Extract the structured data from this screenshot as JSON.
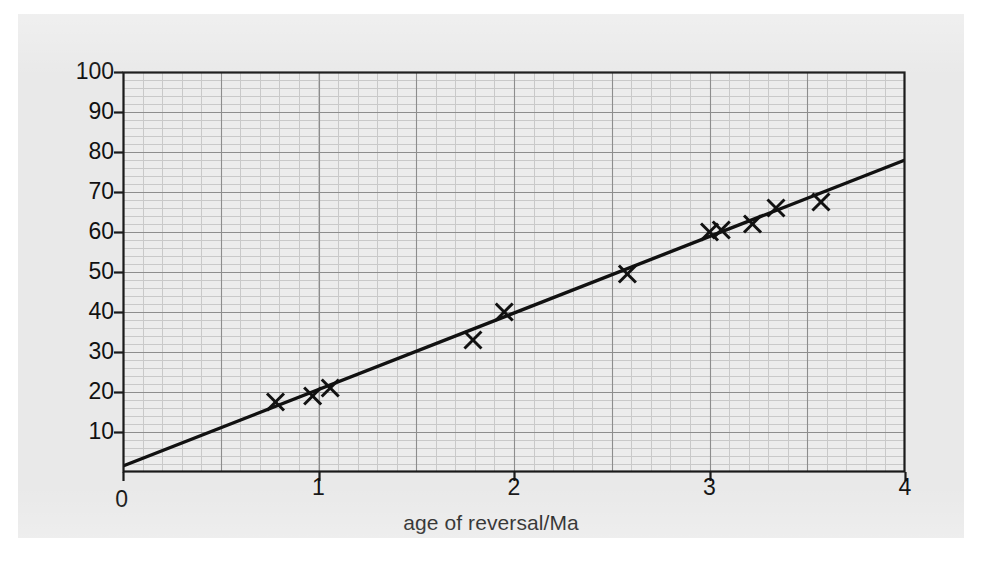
{
  "figure": {
    "background_color": "#e9e9e9",
    "plot_background_color": "#ececec",
    "axis_color": "#1a1a1a",
    "grid_major_color": "#8d8d8d",
    "grid_minor_color": "#c9c9c9",
    "marker_color": "#111111",
    "line_color": "#111111"
  },
  "chart_data": {
    "type": "scatter",
    "title": "",
    "xlabel": "age of reversal/Ma",
    "ylabel": "separation distance/km",
    "xlim": [
      0,
      4
    ],
    "ylim": [
      0,
      100
    ],
    "xticks": [
      0,
      1,
      2,
      3,
      4
    ],
    "xtick_labels": [
      "0",
      "1",
      "2",
      "3",
      "4"
    ],
    "yticks": [
      0,
      10,
      20,
      30,
      40,
      50,
      60,
      70,
      80,
      90,
      100
    ],
    "ytick_labels": [
      "0",
      "10",
      "20",
      "30",
      "40",
      "50",
      "60",
      "70",
      "80",
      "90",
      "100"
    ],
    "grid": true,
    "grid_major_step_x": 0.5,
    "grid_major_step_y": 10,
    "grid_minor_divisions": 5,
    "legend": null,
    "marker": "x",
    "points": [
      {
        "x": 0.78,
        "y": 17.5
      },
      {
        "x": 0.97,
        "y": 19.0
      },
      {
        "x": 1.06,
        "y": 21.0
      },
      {
        "x": 1.79,
        "y": 33.0
      },
      {
        "x": 1.95,
        "y": 40.0
      },
      {
        "x": 2.58,
        "y": 49.5
      },
      {
        "x": 3.0,
        "y": 60.0
      },
      {
        "x": 3.06,
        "y": 60.5
      },
      {
        "x": 3.22,
        "y": 62.0
      },
      {
        "x": 3.34,
        "y": 66.0
      },
      {
        "x": 3.57,
        "y": 67.5
      }
    ],
    "fit_line": {
      "type": "line",
      "x_start": 0.0,
      "y_start": 1.5,
      "x_end": 4.0,
      "y_end": 78.0,
      "slope": 19.1,
      "intercept": 1.5
    }
  }
}
